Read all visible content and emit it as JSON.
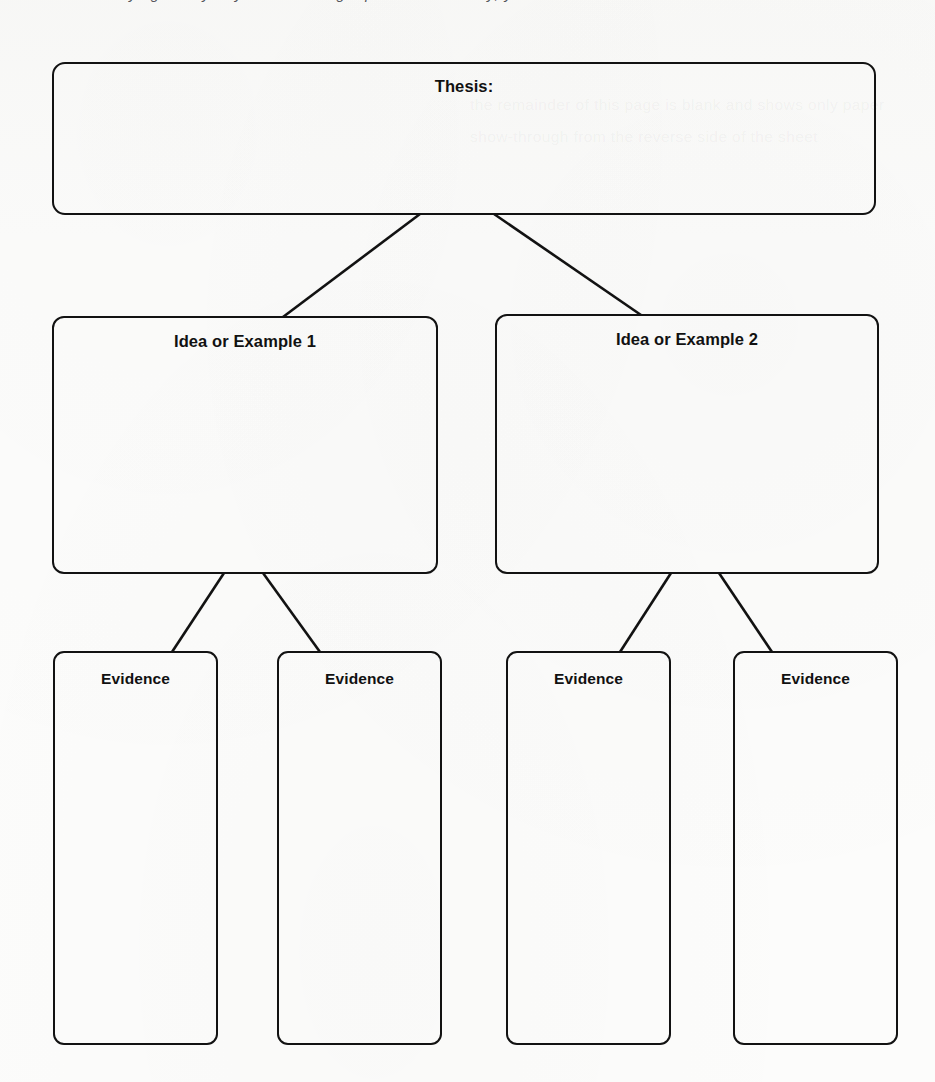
{
  "page": {
    "width": 935,
    "height": 1082,
    "background_color": "#fcfcfb",
    "ink_color": "#121212",
    "top_clipped_text": "trying to say. If you are writing a persuasive essay, your thesis",
    "bleed_through_text_1": "the remainder of this page is blank and shows only paper",
    "bleed_through_text_2": "show-through from the reverse side of the sheet"
  },
  "diagram": {
    "type": "tree",
    "nodes": [
      {
        "id": "thesis",
        "label": "Thesis:",
        "level": 0
      },
      {
        "id": "idea-1",
        "label": "Idea or Example 1",
        "level": 1
      },
      {
        "id": "idea-2",
        "label": "Idea or Example 2",
        "level": 1
      },
      {
        "id": "evidence-1",
        "label": "Evidence",
        "level": 2
      },
      {
        "id": "evidence-2",
        "label": "Evidence",
        "level": 2
      },
      {
        "id": "evidence-3",
        "label": "Evidence",
        "level": 2
      },
      {
        "id": "evidence-4",
        "label": "Evidence",
        "level": 2
      }
    ],
    "edges": [
      {
        "from": "thesis",
        "to": "idea-1"
      },
      {
        "from": "thesis",
        "to": "idea-2"
      },
      {
        "from": "idea-1",
        "to": "evidence-1"
      },
      {
        "from": "idea-1",
        "to": "evidence-2"
      },
      {
        "from": "idea-2",
        "to": "evidence-3"
      },
      {
        "from": "idea-2",
        "to": "evidence-4"
      }
    ]
  }
}
